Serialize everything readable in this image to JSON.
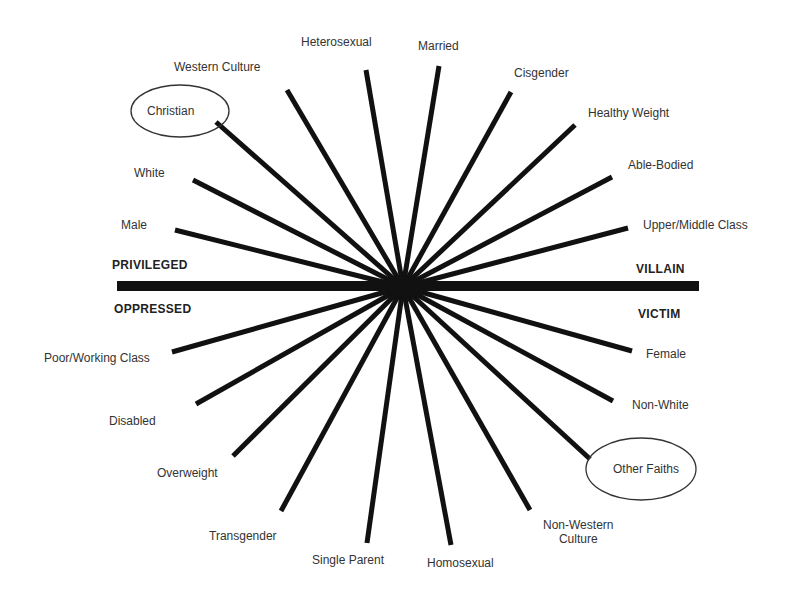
{
  "diagram": {
    "center": {
      "x": 403,
      "y": 287
    },
    "axis": {
      "x1": 117,
      "x2": 699,
      "y": 286,
      "left_top": "PRIVILEGED",
      "left_bottom": "OPPRESSED",
      "right_top": "VILLAIN",
      "right_bottom": "VICTIM"
    },
    "spokes": [
      {
        "label": "Heterosexual",
        "x": 366,
        "y": 70,
        "group": "privileged"
      },
      {
        "label": "Married",
        "x": 439,
        "y": 66,
        "group": "privileged"
      },
      {
        "label": "Western Culture",
        "x": 287,
        "y": 90,
        "group": "privileged"
      },
      {
        "label": "Christian",
        "x": 216,
        "y": 122,
        "group": "privileged",
        "circled": true
      },
      {
        "label": "White",
        "x": 193,
        "y": 180,
        "group": "privileged"
      },
      {
        "label": "Male",
        "x": 175,
        "y": 230,
        "group": "privileged"
      },
      {
        "label": "Cisgender",
        "x": 511,
        "y": 92,
        "group": "privileged"
      },
      {
        "label": "Healthy Weight",
        "x": 575,
        "y": 125,
        "group": "privileged"
      },
      {
        "label": "Able-Bodied",
        "x": 612,
        "y": 177,
        "group": "privileged"
      },
      {
        "label": "Upper/Middle Class",
        "x": 628,
        "y": 228,
        "group": "privileged"
      },
      {
        "label": "Poor/Working Class",
        "x": 172,
        "y": 352,
        "group": "oppressed"
      },
      {
        "label": "Disabled",
        "x": 196,
        "y": 404,
        "group": "oppressed"
      },
      {
        "label": "Overweight",
        "x": 233,
        "y": 456,
        "group": "oppressed"
      },
      {
        "label": "Transgender",
        "x": 281,
        "y": 511,
        "group": "oppressed"
      },
      {
        "label": "Single Parent",
        "x": 367,
        "y": 543,
        "group": "oppressed"
      },
      {
        "label": "Homosexual",
        "x": 451,
        "y": 545,
        "group": "oppressed"
      },
      {
        "label": "Non-Western Culture",
        "x": 530,
        "y": 510,
        "group": "oppressed"
      },
      {
        "label": "Other Faiths",
        "x": 590,
        "y": 459,
        "group": "oppressed",
        "circled": true
      },
      {
        "label": "Non-White",
        "x": 613,
        "y": 401,
        "group": "oppressed"
      },
      {
        "label": "Female",
        "x": 632,
        "y": 351,
        "group": "oppressed"
      }
    ],
    "labels": {
      "heterosexual": "Heterosexual",
      "married": "Married",
      "western_culture": "Western Culture",
      "christian": "Christian",
      "white": "White",
      "male": "Male",
      "cisgender": "Cisgender",
      "healthy_weight": "Healthy Weight",
      "able_bodied": "Able-Bodied",
      "upper_middle_class": "Upper/Middle Class",
      "poor_working_class": "Poor/Working Class",
      "disabled": "Disabled",
      "overweight": "Overweight",
      "transgender": "Transgender",
      "single_parent": "Single Parent",
      "homosexual": "Homosexual",
      "non_western_culture_1": "Non-Western",
      "non_western_culture_2": "Culture",
      "other_faiths": "Other Faiths",
      "non_white": "Non-White",
      "female": "Female"
    },
    "colors": {
      "line": "#111111",
      "text": "#333333",
      "background": "#ffffff"
    }
  }
}
